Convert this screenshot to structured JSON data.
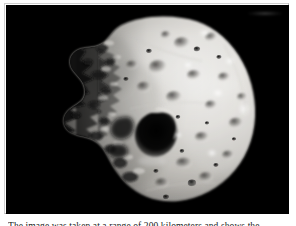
{
  "page": {
    "background_color": "#ffffff"
  },
  "figure": {
    "name": "asteroid-photograph",
    "alt_description": "Grayscale spacecraft photograph of a cratered, irregular asteroid lit from the right against black space",
    "frame_border_color": "#c4c4c4",
    "space_background_color": "#000000",
    "surface_highlight_color": "#f0efec",
    "surface_midtone_color": "#b9b7b2",
    "surface_shadow_color": "#2a2a2a",
    "illumination": "lit from upper right, terminator along the left limb",
    "features": {
      "central_shadow_crater": "large dark irregular crater near the center of the disk",
      "limb": "smooth bright curved limb on the right side",
      "terminator": "jagged shadowed terrain along the left side",
      "small_craters": "numerous small dark pits across the lower and upper surface"
    },
    "plate_artifact": "faint light smudge in the upper right corner of the plate"
  },
  "caption": {
    "text": "The image was taken at a range of 200 kilometers and shows the",
    "visible_state": "clipped by the bottom edge of the screenshot"
  }
}
